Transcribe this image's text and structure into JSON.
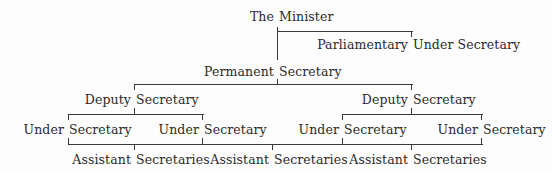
{
  "diagram": {
    "type": "org-chart",
    "nodes": {
      "minister": {
        "first": "The",
        "second": "Minister"
      },
      "parliamentary": {
        "first": "Parliamentary",
        "second": "Under Secretary"
      },
      "permanent": {
        "first": "Permanent",
        "second": "Secretary"
      },
      "deputy_left": {
        "first": "Deputy",
        "second": "Secretary"
      },
      "deputy_right": {
        "first": "Deputy",
        "second": "Secretary"
      },
      "under_1": {
        "first": "Under",
        "second": "Secretary"
      },
      "under_2": {
        "first": "Under",
        "second": "Secretary"
      },
      "under_3": {
        "first": "Under",
        "second": "Secretary"
      },
      "under_4": {
        "first": "Under",
        "second": "Secretary"
      },
      "assistant_1": {
        "first": "Assistant",
        "second": "Secretaries"
      },
      "assistant_2": {
        "first": "Assistant",
        "second": "Secretaries"
      },
      "assistant_3": {
        "first": "Assistant",
        "second": "Secretaries"
      }
    },
    "edges": [
      [
        "The Minister",
        "Parliamentary Under Secretary"
      ],
      [
        "The Minister",
        "Permanent Secretary"
      ],
      [
        "Permanent Secretary",
        "Deputy Secretary (left)"
      ],
      [
        "Permanent Secretary",
        "Deputy Secretary (right)"
      ],
      [
        "Deputy Secretary (left)",
        "Under Secretary 1"
      ],
      [
        "Deputy Secretary (left)",
        "Under Secretary 2"
      ],
      [
        "Deputy Secretary (right)",
        "Under Secretary 3"
      ],
      [
        "Deputy Secretary (right)",
        "Under Secretary 4"
      ],
      [
        "Under Secretaries",
        "Assistant Secretaries 1"
      ],
      [
        "Under Secretaries",
        "Assistant Secretaries 2"
      ],
      [
        "Under Secretaries",
        "Assistant Secretaries 3"
      ]
    ],
    "line_color": "#3a3a3a",
    "text_color": "#2a2a2a"
  }
}
